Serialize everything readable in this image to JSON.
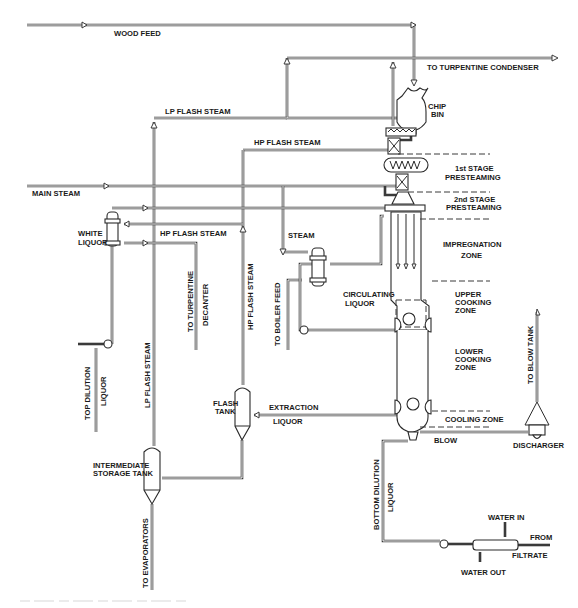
{
  "diagram": {
    "colors": {
      "line": "#3a3a3a",
      "text": "#1a1a1a",
      "background": "#ffffff"
    },
    "streams": {
      "wood_feed": "WOOD FEED",
      "to_turpentine_condenser": "TO TURPENTINE  CONDENSER",
      "lp_flash_steam_top": "LP FLASH  STEAM",
      "hp_flash_steam_top": "HP FLASH STEAM",
      "main_steam": "MAIN STEAM",
      "hp_flash_steam_mid": "HP FLASH STEAM",
      "steam": "STEAM",
      "circulating_liquor_1": "CIRCULATING",
      "circulating_liquor_2": "LIQUOR",
      "to_turpentine_decanter_1": "TO TURPENTINE",
      "to_turpentine_decanter_2": "DECANTER",
      "hp_flash_steam_vertical": "HP FLASH STEAM",
      "to_boiler_feed": "TO BOILER FEED",
      "top_dilution_liquor_1": "TOP DILUTION",
      "top_dilution_liquor_2": "LIQUOR",
      "lp_flash_steam_vertical": "LP FLASH  STEAM",
      "extraction_liquor_1": "EXTRACTION",
      "extraction_liquor_2": "LIQUOR",
      "to_evaporators": "TO EVAPORATORS",
      "blow": "BLOW",
      "to_blow_tank": "TO BLOW TANK",
      "bottom_dilution_liquor_1": "BOTTOM DILUTION",
      "bottom_dilution_liquor_2": "LIQUOR",
      "water_in": "WATER IN",
      "water_out": "WATER OUT",
      "from_filtrate_1": "FROM",
      "from_filtrate_2": "FILTRATE"
    },
    "equipment": {
      "chip_bin_1": "CHIP",
      "chip_bin_2": "BIN",
      "white_liquor_1": "WHITE",
      "white_liquor_2": "LIQUOR",
      "flash_tank_1": "FLASH",
      "flash_tank_2": "TANK",
      "intermediate_storage_1": "INTERMEDIATE",
      "intermediate_storage_2": "STORAGE TANK",
      "discharger": "DISCHARGER"
    },
    "zones": {
      "first_stage_1": "1st STAGE",
      "first_stage_2": "PRESTEAMING",
      "second_stage_1": "2nd STAGE",
      "second_stage_2": "PRESTEAMING",
      "impregnation_1": "IMPREGNATION",
      "impregnation_2": "ZONE",
      "upper_cooking_1": "UPPER",
      "upper_cooking_2": "COOKING",
      "upper_cooking_3": "ZONE",
      "lower_cooking_1": "LOWER",
      "lower_cooking_2": "COOKING",
      "lower_cooking_3": "ZONE",
      "cooling_zone": "COOLING ZONE"
    }
  }
}
